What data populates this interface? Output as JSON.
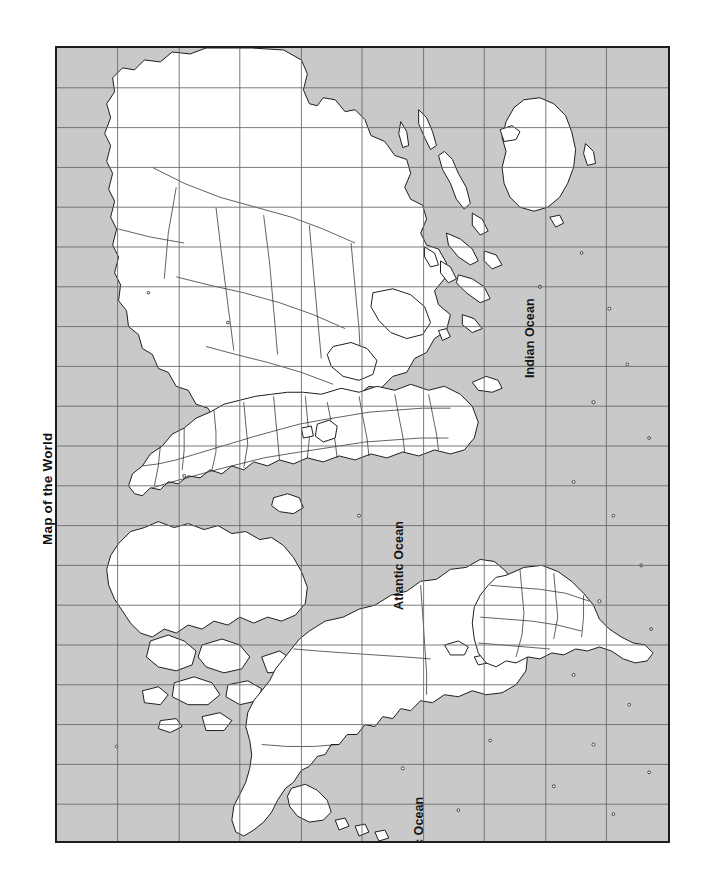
{
  "page": {
    "title": "Map of the World",
    "background_color": "#ffffff"
  },
  "map": {
    "ocean_color": "#c9c9c9",
    "land_color": "#ffffff",
    "outline_color": "#1d1d1d",
    "grid_color": "#6a6a6a",
    "border_color": "#1d1d1d",
    "orientation": "rotated-90-clockwise",
    "grid": {
      "visible": true,
      "meridian_count": 10,
      "parallel_count": 20
    },
    "labels": [
      {
        "name": "indian-ocean",
        "text": "Indian Ocean"
      },
      {
        "name": "atlantic-ocean",
        "text": "Atlantic Ocean"
      },
      {
        "name": "pacific-ocean",
        "text": "Pacific Ocean"
      }
    ]
  }
}
